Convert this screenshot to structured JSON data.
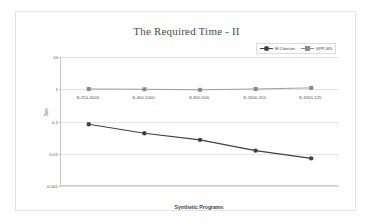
{
  "chart_data": {
    "type": "line",
    "title": "The Required Time - II",
    "xlabel": "Synthetic Programs",
    "ylabel": "Sec",
    "categories": [
      "S-250-2000",
      "S-400-1000",
      "S-800-500",
      "S-1600-250",
      "S-3200-125"
    ],
    "yscale": "log",
    "ylim": [
      0.001,
      10
    ],
    "yticks": [
      "10",
      "1",
      "0.1",
      "0.01",
      "0.001"
    ],
    "ytick_values": [
      10,
      1,
      0.1,
      0.01,
      0.001
    ],
    "grid": true,
    "legend_position": "top-right",
    "series": [
      {
        "name": "M.Checker",
        "color": "#404040",
        "marker": "circle",
        "values": [
          0.082,
          0.043,
          0.027,
          0.0125,
          0.0072
        ]
      },
      {
        "name": "KPP,J65",
        "color": "#8a8a8a",
        "marker": "square",
        "values": [
          1.02,
          1.0,
          0.96,
          1.02,
          1.1
        ]
      }
    ]
  },
  "frame": {
    "border_color": "#e3e3e3",
    "background": "#ffffff"
  }
}
